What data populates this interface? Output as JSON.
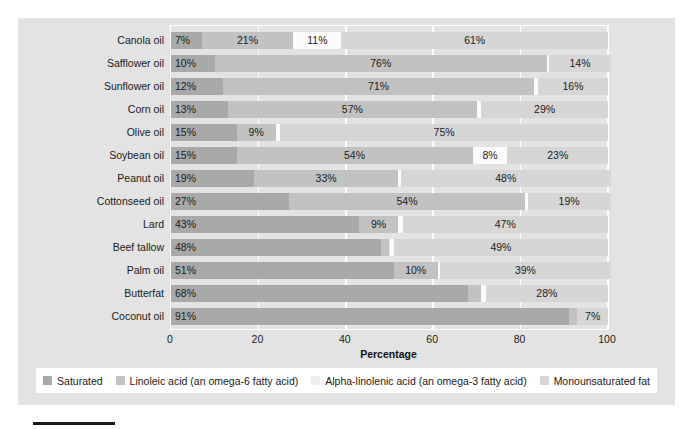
{
  "chart_data": {
    "type": "bar",
    "orientation": "horizontal",
    "stacked": true,
    "title": "",
    "xlabel": "Percentage",
    "ylabel": "",
    "xlim": [
      0,
      100
    ],
    "xticks": [
      0,
      20,
      40,
      60,
      80,
      100
    ],
    "grid": true,
    "legend_position": "bottom",
    "categories": [
      "Canola oil",
      "Safflower oil",
      "Sunflower oil",
      "Corn oil",
      "Olive oil",
      "Soybean oil",
      "Peanut oil",
      "Cottonseed oil",
      "Lard",
      "Beef tallow",
      "Palm oil",
      "Butterfat",
      "Coconut oil"
    ],
    "series": [
      {
        "name": "Saturated",
        "color": "#a9a9a9",
        "values": [
          7,
          10,
          12,
          13,
          15,
          15,
          19,
          27,
          43,
          48,
          51,
          68,
          91
        ],
        "labels": [
          "7%",
          "10%",
          "12%",
          "13%",
          "15%",
          "15%",
          "19%",
          "27%",
          "43%",
          "48%",
          "51%",
          "68%",
          "91%"
        ]
      },
      {
        "name": "Linoleic acid (an omega-6 fatty acid)",
        "color": "#c2c2c2",
        "values": [
          21,
          76,
          71,
          57,
          9,
          54,
          33,
          54,
          9,
          2,
          10,
          3,
          2
        ],
        "labels": [
          "21%",
          "76%",
          "71%",
          "57%",
          "9%",
          "54%",
          "33%",
          "54%",
          "9%",
          "2%",
          "10%",
          "3%",
          "2%"
        ]
      },
      {
        "name": "Alpha-linolenic acid (an omega-3 fatty acid)",
        "color": "#fbfbfb",
        "values": [
          11,
          0.6,
          1,
          1,
          1,
          8,
          0.6,
          0.6,
          1,
          1,
          0.6,
          1,
          0
        ],
        "labels": [
          "11%",
          "Trace",
          "1%",
          "1%",
          "1%",
          "8%",
          "Trace",
          "Trace",
          "1%",
          "1%",
          "Trace",
          "1%",
          ""
        ]
      },
      {
        "name": "Monounsaturated fat",
        "color": "#d6d6d6",
        "values": [
          61,
          14,
          16,
          29,
          75,
          23,
          48,
          19,
          47,
          49,
          39,
          28,
          7
        ],
        "labels": [
          "61%",
          "14%",
          "16%",
          "29%",
          "75%",
          "23%",
          "48%",
          "19%",
          "47%",
          "49%",
          "39%",
          "28%",
          "7%"
        ]
      }
    ]
  },
  "axis": {
    "x_title": "Percentage",
    "tick_labels": [
      "0",
      "20",
      "40",
      "60",
      "80",
      "100"
    ]
  },
  "legend": {
    "items": [
      "Saturated",
      "Linoleic acid (an omega-6 fatty acid)",
      "Alpha-linolenic acid (an omega-3 fatty acid)",
      "Monounsaturated fat"
    ]
  },
  "caption": {
    "text": ""
  },
  "colors": {
    "panel_background": "#e3e3e3",
    "legend_background": "#ffffff",
    "gridline": "#ffffff",
    "text": "#1a1a1a",
    "saturated": "#a9a9a9",
    "linoleic": "#c2c2c2",
    "alpha_linolenic": "#fbfbfb",
    "monounsaturated": "#d6d6d6"
  }
}
